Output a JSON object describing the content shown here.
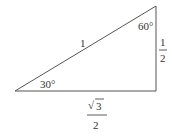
{
  "diagram": {
    "line_color": "#555555",
    "text_color": "#333333",
    "angles": {
      "left": "30°",
      "top": "60°"
    },
    "sides": {
      "hypotenuse": "1",
      "vertical_numerator": "1",
      "vertical_denominator": "2",
      "horizontal_numerator": "3",
      "horizontal_denominator": "2",
      "horizontal_radical": "√"
    }
  }
}
